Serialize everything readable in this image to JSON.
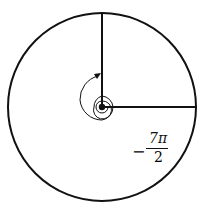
{
  "diagram": {
    "type": "angle-on-circle",
    "angle_label": {
      "sign": "−",
      "numerator": "7π",
      "denominator": "2"
    },
    "colors": {
      "stroke": "#111111",
      "background": "#ffffff"
    }
  }
}
